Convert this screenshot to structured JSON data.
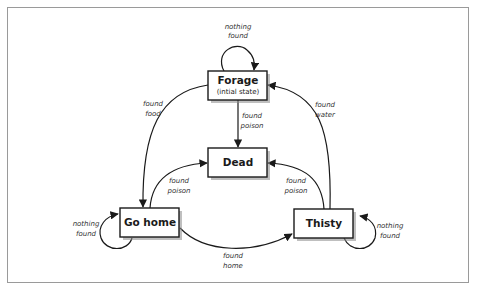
{
  "diagram": {
    "type": "state-machine",
    "states": [
      {
        "id": "forage",
        "label": "Forage",
        "sublabel": "(intial state)"
      },
      {
        "id": "dead",
        "label": "Dead"
      },
      {
        "id": "go_home",
        "label": "Go home"
      },
      {
        "id": "thisty",
        "label": "Thisty"
      }
    ],
    "transitions": [
      {
        "from": "forage",
        "to": "forage",
        "label_line1": "nothing",
        "label_line2": "found"
      },
      {
        "from": "forage",
        "to": "go_home",
        "label_line1": "found",
        "label_line2": "food"
      },
      {
        "from": "forage",
        "to": "dead",
        "label_line1": "found",
        "label_line2": "poison"
      },
      {
        "from": "thisty",
        "to": "forage",
        "label_line1": "found",
        "label_line2": "water"
      },
      {
        "from": "go_home",
        "to": "dead",
        "label_line1": "found",
        "label_line2": "poison"
      },
      {
        "from": "thisty",
        "to": "dead",
        "label_line1": "found",
        "label_line2": "poison"
      },
      {
        "from": "go_home",
        "to": "go_home",
        "label_line1": "nothing",
        "label_line2": "found"
      },
      {
        "from": "go_home",
        "to": "thisty",
        "label_line1": "found",
        "label_line2": "home"
      },
      {
        "from": "thisty",
        "to": "thisty",
        "label_line1": "nothing",
        "label_line2": "found"
      }
    ],
    "colors": {
      "stroke": "#1a1a1a",
      "frame": "#9a9a9a",
      "shadow": "#8a8a8a",
      "background": "#ffffff"
    }
  }
}
